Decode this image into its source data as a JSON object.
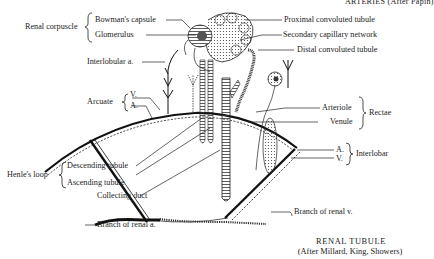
{
  "header_partial": "ARTERIES (After Papin)",
  "labels": {
    "renal_corpuscle": "Renal corpuscle",
    "bowmans_capsule": "Bowman's capsule",
    "glomerulus": "Glomerulus",
    "interlobular_a": "Interlobular a.",
    "arcuate": "Arcuate",
    "arcuate_v": "V.",
    "arcuate_a": "A.",
    "henles_loop": "Henle's loop",
    "descending_tubule": "Descending tubule",
    "ascending_tubule": "Ascending tubule",
    "collecting_duct": "Collecting duct",
    "branch_renal_a": "Branch of renal a.",
    "proximal_convoluted": "Proximal convoluted tubule",
    "secondary_capillary": "Secondary capillary network",
    "distal_convoluted": "Distal convoluted tubule",
    "arteriole": "Arteriole",
    "venule": "Venule",
    "rectae": "Rectae",
    "interlobar_a": "A.",
    "interlobar_v": "V.",
    "interlobar": "Interlobar",
    "branch_renal_v": "Branch of renal v."
  },
  "caption": {
    "title": "RENAL TUBULE",
    "credit": "(After Millard, King, Showers)"
  }
}
